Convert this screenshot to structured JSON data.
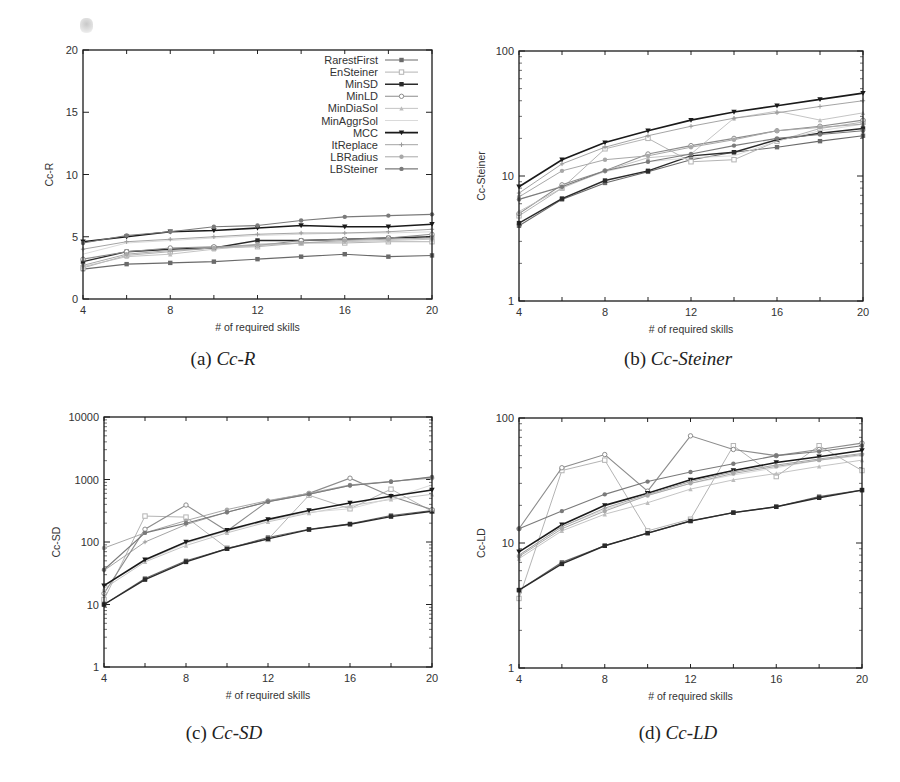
{
  "legend": [
    "RarestFirst",
    "EnSteiner",
    "MinSD",
    "MinLD",
    "MinDiaSol",
    "MinAggrSol",
    "MCC",
    "ItReplace",
    "LBRadius",
    "LBSteiner"
  ],
  "captions": [
    {
      "prefix": "(a) ",
      "name": "Cc-R"
    },
    {
      "prefix": "(b) ",
      "name": "Cc-Steiner"
    },
    {
      "prefix": "(c) ",
      "name": "Cc-SD"
    },
    {
      "prefix": "(d) ",
      "name": "Cc-LD"
    }
  ],
  "chart_data": [
    {
      "type": "line",
      "title": "(a) Cc-R",
      "xlabel": "# of required skills",
      "ylabel": "Cc-R",
      "yscale": "linear",
      "ylim": [
        0,
        20
      ],
      "xlim": [
        4,
        20
      ],
      "xticks": [
        4,
        8,
        12,
        16,
        20
      ],
      "yticks": [
        0,
        5,
        10,
        15,
        20
      ],
      "legend_position": "top-right",
      "grid": false,
      "x": [
        4,
        6,
        8,
        10,
        12,
        14,
        16,
        18,
        20
      ],
      "series": [
        {
          "name": "RarestFirst",
          "values": [
            2.4,
            2.8,
            2.9,
            3.0,
            3.2,
            3.4,
            3.6,
            3.4,
            3.5
          ]
        },
        {
          "name": "EnSteiner",
          "values": [
            2.5,
            3.5,
            3.8,
            4.1,
            4.2,
            4.5,
            4.5,
            4.6,
            4.6
          ]
        },
        {
          "name": "MinSD",
          "values": [
            3.0,
            3.8,
            4.0,
            4.1,
            4.7,
            4.7,
            4.8,
            4.9,
            5.0
          ]
        },
        {
          "name": "MinLD",
          "values": [
            3.2,
            3.8,
            4.1,
            4.2,
            4.3,
            4.7,
            4.8,
            4.9,
            5.2
          ]
        },
        {
          "name": "MinDiaSol",
          "values": [
            2.6,
            3.4,
            3.6,
            4.0,
            4.3,
            4.5,
            4.6,
            4.7,
            4.8
          ]
        },
        {
          "name": "MinAggrSol",
          "values": [
            3.6,
            4.5,
            4.7,
            4.9,
            5.1,
            5.2,
            5.3,
            5.3,
            5.4
          ]
        },
        {
          "name": "MCC",
          "values": [
            4.6,
            5.0,
            5.4,
            5.5,
            5.7,
            5.9,
            5.8,
            5.8,
            6.0
          ]
        },
        {
          "name": "ItReplace",
          "values": [
            4.0,
            4.6,
            4.8,
            5.0,
            5.2,
            5.3,
            5.3,
            5.4,
            5.6
          ]
        },
        {
          "name": "LBRadius",
          "values": [
            2.7,
            3.6,
            3.9,
            4.1,
            4.4,
            4.5,
            4.7,
            4.8,
            4.9
          ]
        },
        {
          "name": "LBSteiner",
          "values": [
            4.5,
            5.1,
            5.4,
            5.8,
            5.9,
            6.3,
            6.6,
            6.7,
            6.8
          ]
        }
      ]
    },
    {
      "type": "line",
      "title": "(b) Cc-Steiner",
      "xlabel": "# of required skills",
      "ylabel": "Cc-Steiner",
      "yscale": "log",
      "ylim": [
        1,
        100
      ],
      "xlim": [
        4,
        20
      ],
      "xticks": [
        4,
        8,
        12,
        16,
        20
      ],
      "yticks": [
        1,
        10,
        100
      ],
      "grid": false,
      "x": [
        4,
        6,
        8,
        10,
        12,
        14,
        16,
        18,
        20
      ],
      "series": [
        {
          "name": "RarestFirst",
          "values": [
            4.0,
            6.5,
            8.8,
            10.8,
            13.5,
            15.5,
            17.0,
            19.0,
            21.0
          ]
        },
        {
          "name": "EnSteiner",
          "values": [
            4.8,
            8.0,
            16.5,
            20.0,
            13.0,
            13.5,
            19.0,
            24.0,
            27.0
          ]
        },
        {
          "name": "MinSD",
          "values": [
            4.2,
            6.6,
            9.2,
            11.0,
            14.5,
            15.5,
            19.5,
            22.0,
            24.0
          ]
        },
        {
          "name": "MinLD",
          "values": [
            5.0,
            8.5,
            11.0,
            15.0,
            17.5,
            20.0,
            23.0,
            25.0,
            28.0
          ]
        },
        {
          "name": "MinDiaSol",
          "values": [
            5.2,
            8.0,
            11.0,
            14.0,
            15.0,
            29.0,
            33.0,
            28.0,
            32.0
          ]
        },
        {
          "name": "MinAggrSol",
          "values": [
            6.5,
            8.3,
            10.8,
            13.0,
            14.0,
            14.5,
            19.0,
            23.0,
            26.0
          ]
        },
        {
          "name": "MCC",
          "values": [
            8.2,
            13.5,
            18.5,
            23.0,
            28.0,
            32.5,
            36.5,
            41.0,
            46.0
          ]
        },
        {
          "name": "ItReplace",
          "values": [
            7.3,
            12.5,
            17.0,
            21.0,
            25.0,
            29.0,
            32.0,
            36.0,
            40.0
          ]
        },
        {
          "name": "LBRadius",
          "values": [
            6.8,
            11.0,
            13.5,
            14.5,
            17.0,
            19.5,
            23.0,
            24.5,
            26.0
          ]
        },
        {
          "name": "LBSteiner",
          "values": [
            6.5,
            8.2,
            11.0,
            13.0,
            15.0,
            17.5,
            20.0,
            21.5,
            23.0
          ]
        }
      ]
    },
    {
      "type": "line",
      "title": "(c) Cc-SD",
      "xlabel": "# of required skills",
      "ylabel": "Cc-SD",
      "yscale": "log",
      "ylim": [
        1,
        10000
      ],
      "xlim": [
        4,
        20
      ],
      "xticks": [
        4,
        8,
        12,
        16,
        20
      ],
      "yticks": [
        1,
        10,
        100,
        1000,
        10000
      ],
      "grid": false,
      "x": [
        4,
        6,
        8,
        10,
        12,
        14,
        16,
        18,
        20
      ],
      "series": [
        {
          "name": "RarestFirst",
          "values": [
            10,
            26,
            50,
            78,
            118,
            160,
            195,
            265,
            320
          ]
        },
        {
          "name": "EnSteiner",
          "values": [
            12,
            260,
            250,
            80,
            110,
            560,
            340,
            700,
            310
          ]
        },
        {
          "name": "MinSD",
          "values": [
            10,
            25,
            48,
            78,
            112,
            158,
            192,
            255,
            310
          ]
        },
        {
          "name": "MinLD",
          "values": [
            15,
            160,
            390,
            150,
            450,
            600,
            1050,
            540,
            330
          ]
        },
        {
          "name": "MinDiaSol",
          "values": [
            18,
            48,
            88,
            140,
            210,
            290,
            380,
            480,
            580
          ]
        },
        {
          "name": "MinAggrSol",
          "values": [
            20,
            50,
            95,
            150,
            220,
            300,
            340,
            500,
            820
          ]
        },
        {
          "name": "MCC",
          "values": [
            20,
            52,
            100,
            155,
            230,
            320,
            420,
            540,
            680
          ]
        },
        {
          "name": "ItReplace",
          "values": [
            35,
            100,
            190,
            300,
            440,
            580,
            800,
            930,
            1080
          ]
        },
        {
          "name": "LBRadius",
          "values": [
            80,
            140,
            220,
            330,
            460,
            600,
            820,
            930,
            1050
          ]
        },
        {
          "name": "LBSteiner",
          "values": [
            36,
            140,
            200,
            300,
            440,
            580,
            800,
            920,
            1100
          ]
        }
      ]
    },
    {
      "type": "line",
      "title": "(d) Cc-LD",
      "xlabel": "# of required skills",
      "ylabel": "Cc-LD",
      "yscale": "log",
      "ylim": [
        1,
        100
      ],
      "xlim": [
        4,
        20
      ],
      "xticks": [
        4,
        8,
        12,
        16,
        20
      ],
      "yticks": [
        1,
        10,
        100
      ],
      "grid": false,
      "x": [
        4,
        6,
        8,
        10,
        12,
        14,
        16,
        18,
        20
      ],
      "series": [
        {
          "name": "RarestFirst",
          "values": [
            4.2,
            7.0,
            9.5,
            12.0,
            15.0,
            17.5,
            19.5,
            23.5,
            26.5
          ]
        },
        {
          "name": "EnSteiner",
          "values": [
            3.6,
            38.0,
            46.0,
            12.5,
            15.5,
            60.0,
            34.0,
            60.0,
            38.0
          ]
        },
        {
          "name": "MinSD",
          "values": [
            4.2,
            6.8,
            9.5,
            12.0,
            15.0,
            17.5,
            19.5,
            23.0,
            26.5
          ]
        },
        {
          "name": "MinLD",
          "values": [
            13.0,
            40.0,
            51.0,
            26.0,
            72.0,
            56.0,
            50.0,
            56.0,
            63.0
          ]
        },
        {
          "name": "MinDiaSol",
          "values": [
            7.5,
            12.5,
            17.0,
            21.0,
            27.0,
            32.0,
            36.0,
            41.0,
            46.0
          ]
        },
        {
          "name": "MinAggrSol",
          "values": [
            8.0,
            13.5,
            18.5,
            24.0,
            30.0,
            35.0,
            40.0,
            46.0,
            50.0
          ]
        },
        {
          "name": "MCC",
          "values": [
            8.5,
            14.0,
            20.0,
            25.0,
            32.0,
            38.0,
            44.0,
            49.0,
            55.0
          ]
        },
        {
          "name": "ItReplace",
          "values": [
            8.0,
            13.5,
            19.0,
            24.5,
            31.0,
            37.0,
            42.0,
            47.0,
            52.0
          ]
        },
        {
          "name": "LBRadius",
          "values": [
            7.8,
            13.0,
            18.0,
            24.0,
            30.0,
            36.0,
            41.0,
            46.0,
            51.0
          ]
        },
        {
          "name": "LBSteiner",
          "values": [
            13.0,
            18.0,
            24.5,
            31.0,
            37.0,
            43.0,
            50.0,
            54.0,
            60.0
          ]
        }
      ]
    }
  ]
}
